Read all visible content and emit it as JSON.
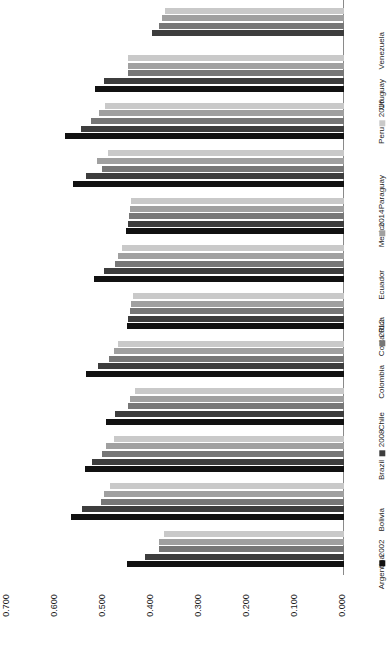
{
  "chart_data": {
    "type": "bar",
    "orientation": "horizontal-rotated",
    "title": "",
    "xlabel": "",
    "ylabel": "",
    "xlim": [
      0.0,
      0.7
    ],
    "tick_labels": [
      "0.000",
      "0.100",
      "0.200",
      "0.300",
      "0.400",
      "0.500",
      "0.600",
      "0.700"
    ],
    "tick_values": [
      0.0,
      0.1,
      0.2,
      0.3,
      0.4,
      0.5,
      0.6,
      0.7
    ],
    "grid": false,
    "legend_position": "right",
    "categories": [
      "Argentina",
      "Bolivia",
      "Brazil",
      "Chile",
      "Colombia",
      "Costa Rica",
      "Ecuador",
      "Mexico",
      "Paraguay",
      "Peru",
      "Uruguay",
      "Venezuela"
    ],
    "series": [
      {
        "name": "2002",
        "color": "#111111",
        "values": [
          0.452,
          0.568,
          0.54,
          0.495,
          0.537,
          0.452,
          0.521,
          0.454,
          0.565,
          0.581,
          0.518,
          0.427
        ]
      },
      {
        "name": "2008",
        "color": "#3d3d3d",
        "values": [
          0.414,
          0.546,
          0.524,
          0.477,
          0.512,
          0.45,
          0.501,
          0.451,
          0.537,
          0.548,
          0.5,
          0.4
        ]
      },
      {
        "name": "2012",
        "color": "#777777",
        "values": [
          0.386,
          0.506,
          0.504,
          0.45,
          0.489,
          0.446,
          0.478,
          0.448,
          0.505,
          0.528,
          0.45,
          0.386
        ]
      },
      {
        "name": "2014",
        "color": "#a0a0a0",
        "values": [
          0.386,
          0.499,
          0.496,
          0.446,
          0.48,
          0.444,
          0.47,
          0.446,
          0.514,
          0.51,
          0.45,
          0.38
        ]
      },
      {
        "name": "2016",
        "color": "#c9c9c9",
        "values": [
          0.376,
          0.487,
          0.48,
          0.436,
          0.47,
          0.44,
          0.463,
          0.444,
          0.492,
          0.498,
          0.45,
          0.372
        ]
      }
    ],
    "missing": [
      {
        "category": "Venezuela",
        "series": "2002"
      }
    ]
  },
  "legend": {
    "items": [
      {
        "label": "2002",
        "color": "#111111"
      },
      {
        "label": "2008",
        "color": "#3d3d3d"
      },
      {
        "label": "2012",
        "color": "#777777"
      },
      {
        "label": "2014",
        "color": "#a0a0a0"
      },
      {
        "label": "2016",
        "color": "#c9c9c9"
      }
    ]
  }
}
